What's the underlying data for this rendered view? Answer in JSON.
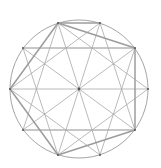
{
  "diagram": {
    "title": "",
    "center": [
      79,
      89
    ],
    "radius": 69,
    "vertices": [
      {
        "id": "V0",
        "x": 148,
        "y": 89
      },
      {
        "id": "V1",
        "x": 135,
        "y": 130
      },
      {
        "id": "V2",
        "x": 100,
        "y": 155
      },
      {
        "id": "V3",
        "x": 58,
        "y": 155
      },
      {
        "id": "V4",
        "x": 23,
        "y": 130
      },
      {
        "id": "V5",
        "x": 10,
        "y": 89
      },
      {
        "id": "V6",
        "x": 23,
        "y": 48
      },
      {
        "id": "V7",
        "x": 58,
        "y": 23
      },
      {
        "id": "V8",
        "x": 100,
        "y": 23
      },
      {
        "id": "V9",
        "x": 135,
        "y": 48
      }
    ],
    "thin_lines": [
      [
        "V0",
        "V5"
      ],
      [
        "V1",
        "V6"
      ],
      [
        "V2",
        "V7"
      ],
      [
        "V3",
        "V8"
      ],
      [
        "V4",
        "V9"
      ],
      [
        "V6",
        "V9"
      ],
      [
        "V4",
        "V1"
      ],
      [
        "V0",
        "V3"
      ],
      [
        "V1",
        "V4"
      ],
      [
        "V2",
        "V5"
      ],
      [
        "V3",
        "V6"
      ],
      [
        "V4",
        "V7"
      ],
      [
        "V5",
        "V8"
      ],
      [
        "V6",
        "V9"
      ],
      [
        "V7",
        "V0"
      ],
      [
        "V8",
        "V1"
      ],
      [
        "V9",
        "V2"
      ]
    ],
    "bold_lines": [
      [
        "V7",
        "V9"
      ],
      [
        "V9",
        "V1"
      ],
      [
        "V1",
        "V3"
      ],
      [
        "V3",
        "V5"
      ],
      [
        "V5",
        "V7"
      ],
      [
        "V7",
        "V8"
      ]
    ],
    "colors": {
      "stroke": "#a8a8a8",
      "bold_stroke": "#9c9c9c",
      "circle": "#9a9a9a",
      "point": "#555555",
      "background": "#ffffff"
    }
  }
}
